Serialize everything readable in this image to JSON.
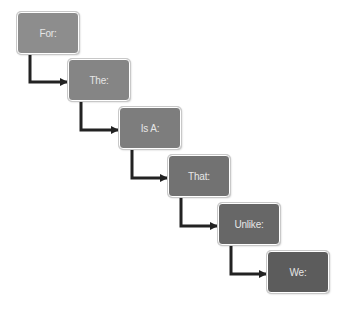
{
  "diagram": {
    "type": "staircase-flow",
    "steps": [
      {
        "label": "For:",
        "x": 17,
        "y": 12,
        "color": "#8d8d8d"
      },
      {
        "label": "The:",
        "x": 68,
        "y": 59,
        "color": "#858585"
      },
      {
        "label": "Is A:",
        "x": 119,
        "y": 107,
        "color": "#7d7d7d"
      },
      {
        "label": "That:",
        "x": 168,
        "y": 155,
        "color": "#727272"
      },
      {
        "label": "Unlike:",
        "x": 218,
        "y": 203,
        "color": "#676767"
      },
      {
        "label": "We:",
        "x": 267,
        "y": 251,
        "color": "#5c5c5c"
      }
    ],
    "arrow_color": "#222222"
  }
}
